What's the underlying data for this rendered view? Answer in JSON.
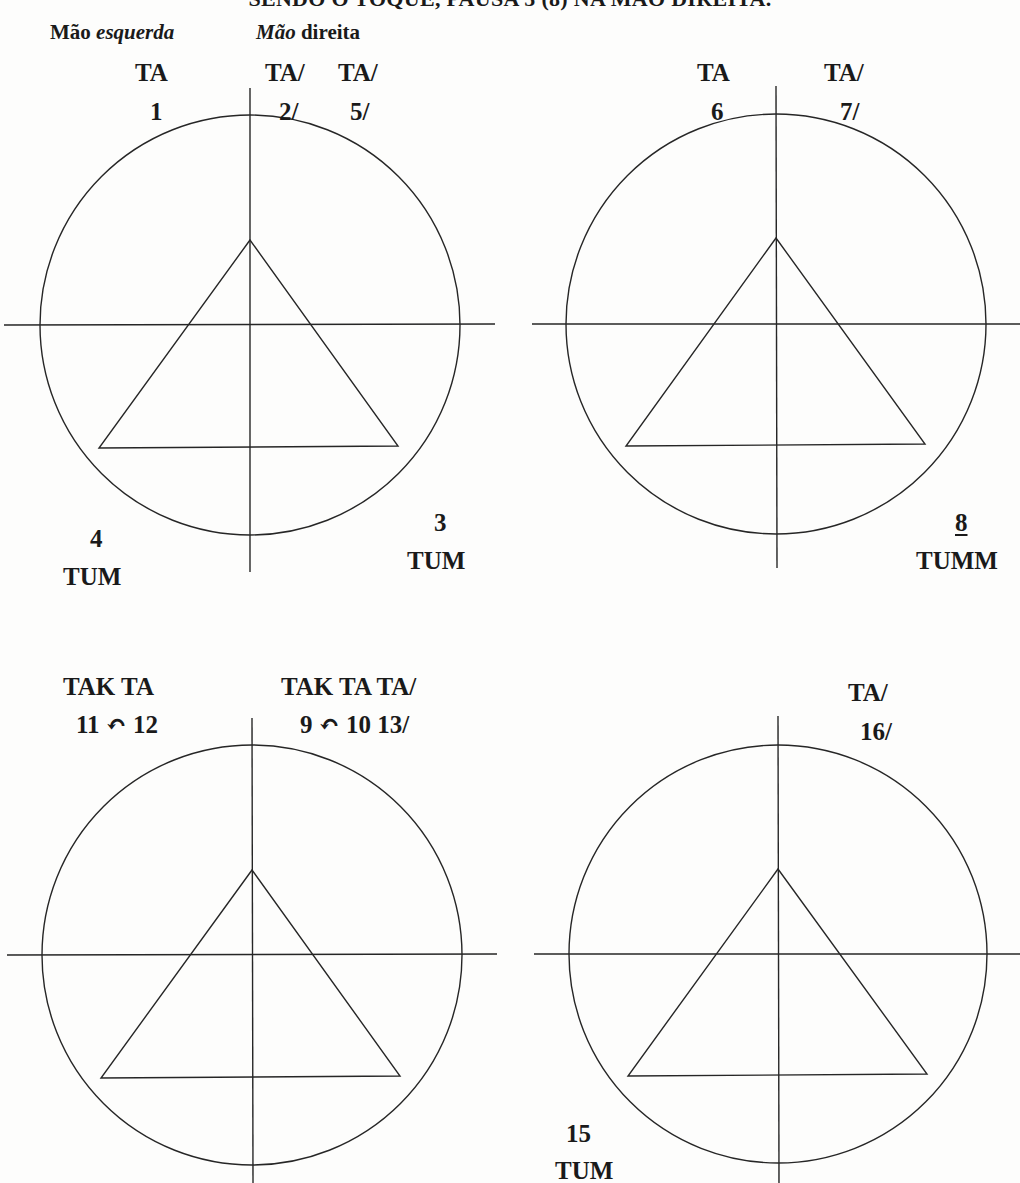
{
  "title": "SENDO O TOQUE, PAUSA 5 (8) NA MÃO DIREITA.",
  "hands": {
    "left": {
      "word1": "Mão",
      "word2": "esquerda"
    },
    "right": {
      "word1": "Mão",
      "word2": "direita"
    }
  },
  "colors": {
    "line": "#262626",
    "text": "#1a1a1a",
    "background": "#fdfdfc"
  },
  "diagrams": [
    {
      "id": 1,
      "circle": {
        "cx": 250,
        "cy": 325,
        "r": 210
      },
      "triangle": [
        [
          250,
          240
        ],
        [
          99,
          448
        ],
        [
          398,
          446
        ]
      ],
      "labels": [
        {
          "syllable": "TA",
          "count": "1",
          "position": "top-left"
        },
        {
          "syllable": "TA/",
          "count": "2/",
          "position": "top-right-1"
        },
        {
          "syllable": "TA/",
          "count": "5/",
          "position": "top-right-2"
        },
        {
          "syllable": "TUM",
          "count": "3",
          "position": "bottom-right"
        },
        {
          "syllable": "TUM",
          "count": "4",
          "position": "bottom-left"
        }
      ]
    },
    {
      "id": 2,
      "circle": {
        "cx": 776,
        "cy": 324,
        "r": 210
      },
      "triangle": [
        [
          776,
          238
        ],
        [
          626,
          446
        ],
        [
          925,
          444
        ]
      ],
      "labels": [
        {
          "syllable": "TA",
          "count": "6",
          "position": "top-left"
        },
        {
          "syllable": "TA/",
          "count": "7/",
          "position": "top-right"
        },
        {
          "syllable": "TUMM",
          "count": "8",
          "count_underlined": true,
          "position": "bottom-right"
        }
      ]
    },
    {
      "id": 3,
      "circle": {
        "cx": 252,
        "cy": 955,
        "r": 210
      },
      "triangle": [
        [
          252,
          870
        ],
        [
          101,
          1078
        ],
        [
          400,
          1076
        ]
      ],
      "labels": [
        {
          "syllable": "TAK TA",
          "count": "11 ↶ 12",
          "position": "top-left"
        },
        {
          "syllable": "TAK TA TA/",
          "count": "9 ↶ 10 13/",
          "position": "top-right"
        }
      ]
    },
    {
      "id": 4,
      "circle": {
        "cx": 778,
        "cy": 954,
        "r": 209
      },
      "triangle": [
        [
          778,
          869
        ],
        [
          628,
          1076
        ],
        [
          927,
          1074
        ]
      ],
      "labels": [
        {
          "syllable": "TA/",
          "count": "16/",
          "position": "top-right"
        },
        {
          "syllable": "TUM",
          "count": "15",
          "position": "bottom-left"
        }
      ]
    }
  ]
}
